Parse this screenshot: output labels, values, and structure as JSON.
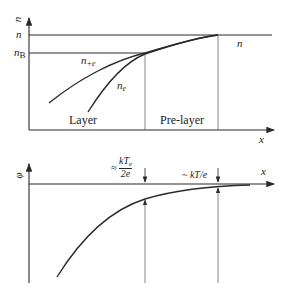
{
  "top_plot": {
    "y_axis_label": "n",
    "x_axis_label": "x",
    "level_n": "n",
    "level_nB_main": "n",
    "level_nB_sub": "B",
    "curve_ion_main": "n",
    "curve_ion_sub": "+e",
    "curve_electron_main": "n",
    "curve_electron_sub": "e",
    "far_label": "n",
    "region_layer": "Layer",
    "region_prelayer": "Pre-layer"
  },
  "bottom_plot": {
    "y_axis_label": "φ",
    "x_axis_label": "x",
    "drop_layer_prefix": "≈",
    "drop_layer_num": "kT",
    "drop_layer_num_sub": "e",
    "drop_layer_den": "2e",
    "drop_prelayer": "~ kT/e"
  },
  "colors": {
    "line": "#2a2a2a",
    "thin": "#555555"
  }
}
